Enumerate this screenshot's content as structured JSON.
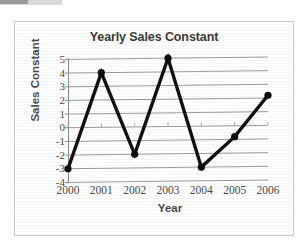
{
  "chart_data": {
    "type": "line",
    "title": "Yearly Sales Constant",
    "xlabel": "Year",
    "ylabel": "Sales Constant",
    "categories": [
      "2000",
      "2001",
      "2002",
      "2003",
      "2004",
      "2005",
      "2006"
    ],
    "values": [
      -3,
      4,
      -2,
      5,
      -3,
      -0.8,
      2.2
    ],
    "series": [
      {
        "name": "Sales Constant",
        "values": [
          -3,
          4,
          -2,
          5,
          -3,
          -0.8,
          2.2
        ]
      }
    ],
    "ylim": [
      -4,
      5
    ],
    "yticks": [
      5,
      4,
      3,
      2,
      1,
      0,
      -1,
      -2,
      -3,
      -4
    ],
    "ytick_labels": [
      "5",
      "4",
      "3",
      "2",
      "1",
      "0",
      "-1",
      "-2",
      "-3",
      "-4"
    ],
    "xlim": [
      0,
      6
    ],
    "grid": true,
    "grid_axis": "y",
    "legend": false,
    "legend_position": "none",
    "marker": "circle",
    "line_color": "#111111",
    "marker_color": "#0d0d0d",
    "gridline_color": "#9d9d9d",
    "plot_background": "#ffffff",
    "border_color": "#c9c9c9",
    "title_color": "#3a3a3a",
    "axis_label_color": "#4a4a4a",
    "annotations": []
  },
  "icons": {
    "chart_glyph": "line-chart-icon"
  }
}
